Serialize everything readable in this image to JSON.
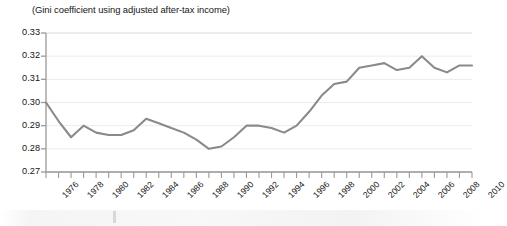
{
  "chart_data": {
    "type": "line",
    "title": "(Gini coefficient using adjusted after-tax income)",
    "xlabel": "",
    "ylabel": "",
    "ylim": [
      0.27,
      0.33
    ],
    "xlim": [
      1976,
      2010
    ],
    "grid": true,
    "legend_position": "none",
    "y_ticks": [
      "0.33",
      "0.32",
      "0.31",
      "0.30",
      "0.29",
      "0.28",
      "0.27"
    ],
    "y_tick_values": [
      0.33,
      0.32,
      0.31,
      0.3,
      0.29,
      0.28,
      0.27
    ],
    "x_ticks": [
      "1976",
      "1978",
      "1980",
      "1982",
      "1984",
      "1986",
      "1988",
      "1990",
      "1992",
      "1994",
      "1996",
      "1998",
      "2000",
      "2002",
      "2004",
      "2006",
      "2008",
      "2010"
    ],
    "x": [
      1976,
      1977,
      1978,
      1979,
      1980,
      1981,
      1982,
      1983,
      1984,
      1985,
      1986,
      1987,
      1988,
      1989,
      1990,
      1991,
      1992,
      1993,
      1994,
      1995,
      1996,
      1997,
      1998,
      1999,
      2000,
      2001,
      2002,
      2003,
      2004,
      2005,
      2006,
      2007,
      2008,
      2009,
      2010
    ],
    "values": [
      0.3,
      0.292,
      0.285,
      0.29,
      0.287,
      0.286,
      0.286,
      0.288,
      0.293,
      0.291,
      0.289,
      0.287,
      0.284,
      0.28,
      0.281,
      0.285,
      0.29,
      0.29,
      0.289,
      0.287,
      0.29,
      0.296,
      0.303,
      0.308,
      0.309,
      0.315,
      0.316,
      0.317,
      0.314,
      0.315,
      0.32,
      0.315,
      0.313,
      0.316,
      0.316
    ],
    "series_color": "#8a8a8a",
    "grid_color": "#ebebeb",
    "axis_color": "#9a9a9a"
  },
  "artifacts": {
    "scan_band_label": "scan-artifact"
  }
}
